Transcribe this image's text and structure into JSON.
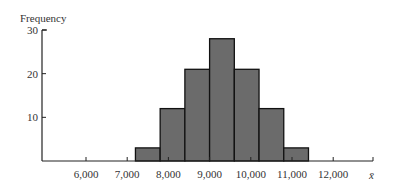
{
  "chart_data": {
    "type": "bar",
    "title": "",
    "ylabel": "Frequency",
    "xlabel": "x̄",
    "ylim": [
      0,
      30
    ],
    "yticks": [
      10,
      20,
      30
    ],
    "xticks": [
      6000,
      7000,
      8000,
      9000,
      10000,
      11000,
      12000
    ],
    "xtick_labels": [
      "6,000",
      "7,000",
      "8,000",
      "9,000",
      "10,000",
      "11,000",
      "12,000"
    ],
    "xlim": [
      5000,
      13000
    ],
    "bin_width": 600,
    "bins": [
      {
        "start": 7200,
        "end": 7800,
        "value": 3
      },
      {
        "start": 7800,
        "end": 8400,
        "value": 12
      },
      {
        "start": 8400,
        "end": 9000,
        "value": 21
      },
      {
        "start": 9000,
        "end": 9600,
        "value": 28
      },
      {
        "start": 9600,
        "end": 10200,
        "value": 21
      },
      {
        "start": 10200,
        "end": 10800,
        "value": 12
      },
      {
        "start": 10800,
        "end": 11400,
        "value": 3
      }
    ],
    "categories": [
      "7,500",
      "8,100",
      "8,700",
      "9,300",
      "9,900",
      "10,500",
      "11,100"
    ],
    "values": [
      3,
      12,
      21,
      28,
      21,
      12,
      3
    ],
    "grid": false,
    "legend": null
  },
  "colors": {
    "bar_fill": "#6b6b6b",
    "bar_stroke": "#111111",
    "axis": "#222222"
  }
}
